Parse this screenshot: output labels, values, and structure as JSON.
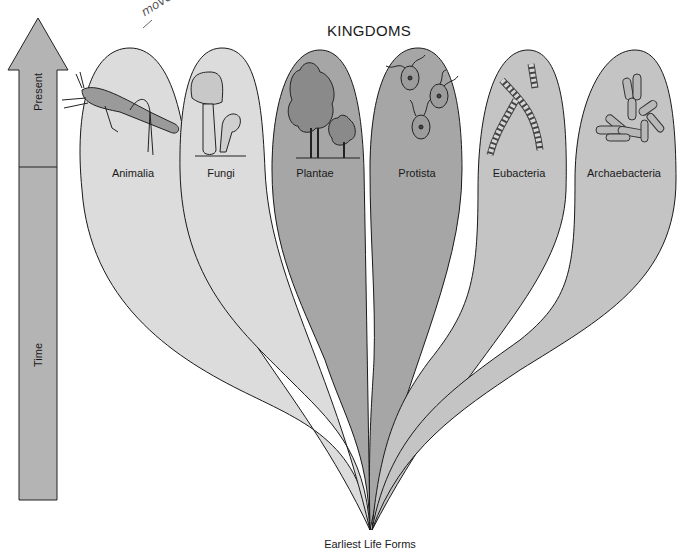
{
  "title": "KINGDOMS",
  "footer": "Earliest Life Forms",
  "annotation": "move",
  "time_arrow": {
    "top_label": "Present",
    "bottom_label": "Time",
    "color": "#b4b4b4"
  },
  "kingdoms": [
    {
      "name": "Animalia",
      "icon": "grasshopper-icon",
      "fill": "#dcdcdc"
    },
    {
      "name": "Fungi",
      "icon": "mushroom-icon",
      "fill": "#dcdcdc"
    },
    {
      "name": "Plantae",
      "icon": "tree-icon",
      "fill": "#a6a6a6"
    },
    {
      "name": "Protista",
      "icon": "protist-icon",
      "fill": "#a6a6a6"
    },
    {
      "name": "Eubacteria",
      "icon": "chain-bacteria-icon",
      "fill": "#c4c4c4"
    },
    {
      "name": "Archaebacteria",
      "icon": "rod-bacteria-icon",
      "fill": "#c4c4c4"
    }
  ],
  "colors": {
    "light": "#dcdcdc",
    "dark": "#a6a6a6",
    "medium": "#c4c4c4",
    "outline": "#1a1a1a"
  }
}
